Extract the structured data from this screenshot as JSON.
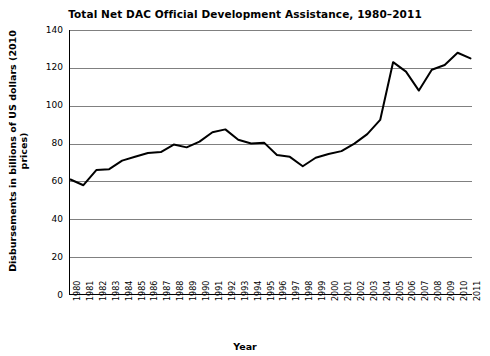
{
  "chart_data": {
    "type": "line",
    "title": "Total Net DAC Official Development Assistance, 1980–2011",
    "xlabel": "Year",
    "ylabel": "Disbursements in billions of US dollars (2010 prices)",
    "ylim": [
      0,
      140
    ],
    "ytick_labels": [
      "0",
      "20",
      "40",
      "60",
      "80",
      "100",
      "120",
      "140"
    ],
    "yticks": [
      0,
      20,
      40,
      60,
      80,
      100,
      120,
      140
    ],
    "grid": true,
    "legend": "none",
    "line_color": "#000000",
    "categories": [
      "1980",
      "1981",
      "1982",
      "1983",
      "1984",
      "1985",
      "1986",
      "1987",
      "1988",
      "1989",
      "1990",
      "1991",
      "1992",
      "1993",
      "1994",
      "1995",
      "1996",
      "1997",
      "1998",
      "1999",
      "2000",
      "2001",
      "2002",
      "2003",
      "2004",
      "2005",
      "2006",
      "2007",
      "2008",
      "2009",
      "2010",
      "2011"
    ],
    "x": [
      1980,
      1981,
      1982,
      1983,
      1984,
      1985,
      1986,
      1987,
      1988,
      1989,
      1990,
      1991,
      1992,
      1993,
      1994,
      1995,
      1996,
      1997,
      1998,
      1999,
      2000,
      2001,
      2002,
      2003,
      2004,
      2005,
      2006,
      2007,
      2008,
      2009,
      2010,
      2011
    ],
    "values": [
      61,
      58,
      66,
      66.5,
      71,
      73,
      75,
      75.5,
      79.5,
      78,
      81,
      86,
      87.5,
      82,
      80,
      80.5,
      74,
      73,
      68,
      72.5,
      74.5,
      76,
      80,
      85,
      92.5,
      123,
      118,
      108,
      119,
      121.5,
      128,
      125
    ]
  }
}
